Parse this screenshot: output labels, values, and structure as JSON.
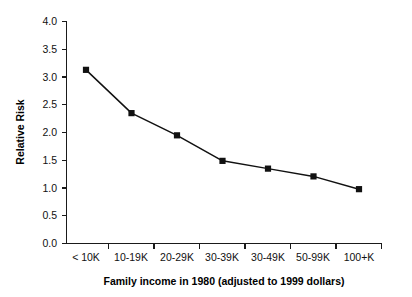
{
  "chart_data": {
    "type": "line",
    "title": "",
    "xlabel": "Family income in 1980 (adjusted to 1999 dollars)",
    "ylabel": "Relative Risk",
    "categories": [
      "< 10K",
      "10-19K",
      "20-29K",
      "30-39K",
      "30-49K",
      "50-99K",
      "100+K"
    ],
    "values": [
      3.12,
      2.34,
      1.94,
      1.48,
      1.34,
      1.2,
      0.97
    ],
    "ylim": [
      0.0,
      4.0
    ],
    "yticks": [
      "0.0",
      "0.5",
      "1.0",
      "1.5",
      "2.0",
      "2.5",
      "3.0",
      "3.5",
      "4.0"
    ],
    "ytick_values": [
      0.0,
      0.5,
      1.0,
      1.5,
      2.0,
      2.5,
      3.0,
      3.5,
      4.0
    ],
    "grid": false,
    "legend": false,
    "marker": "filled-square",
    "line_color": "#111111",
    "marker_color": "#111111",
    "background": "#ffffff"
  },
  "axes": {
    "y_title": "Relative Risk",
    "x_title": "Family income in 1980 (adjusted to 1999 dollars)"
  }
}
